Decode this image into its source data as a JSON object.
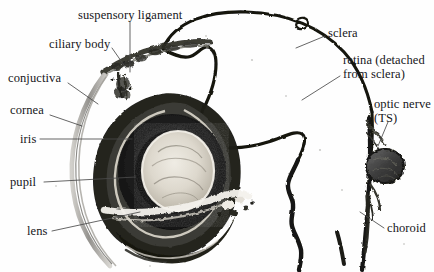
{
  "figure": {
    "background_color": "#fefefe",
    "ink_color": "#16161a",
    "leader_color": "#4a4a4a",
    "width": 434,
    "height": 272
  },
  "labels": [
    {
      "id": "suspensory-ligament",
      "text": "suspensory ligament",
      "x": 78,
      "y": 9,
      "align": "left"
    },
    {
      "id": "ciliary-body",
      "text": "ciliary body",
      "x": 49,
      "y": 38,
      "align": "left"
    },
    {
      "id": "conjuctiva",
      "text": "conjuctiva",
      "x": 8,
      "y": 72,
      "align": "left"
    },
    {
      "id": "cornea",
      "text": "cornea",
      "x": 10,
      "y": 104,
      "align": "left"
    },
    {
      "id": "iris",
      "text": "iris",
      "x": 20,
      "y": 133,
      "align": "left"
    },
    {
      "id": "pupil",
      "text": "pupil",
      "x": 10,
      "y": 176,
      "align": "left"
    },
    {
      "id": "lens",
      "text": "lens",
      "x": 27,
      "y": 225,
      "align": "left"
    },
    {
      "id": "sclera",
      "text": "sclera",
      "x": 328,
      "y": 27,
      "align": "left"
    },
    {
      "id": "retina-detached",
      "text": "retina (detached\nfrom sclera)",
      "x": 343,
      "y": 54,
      "align": "left"
    },
    {
      "id": "optic-nerve",
      "text": "optic nerve\n(TS)",
      "x": 374,
      "y": 98,
      "align": "left"
    },
    {
      "id": "choroid",
      "text": "choroid",
      "x": 387,
      "y": 222,
      "align": "left"
    }
  ],
  "structures": [
    {
      "id": "sclera-outline",
      "name": "sclera",
      "description": "large dark outline arc forming the posterior wall of the eyeball"
    },
    {
      "id": "retina-sheet",
      "name": "retina (detached)",
      "description": "thick dark sheet folded away from the sclera inside the globe"
    },
    {
      "id": "choroid-strip",
      "name": "choroid",
      "description": "narrow dark pigmented strip beside the optic nerve at lower right"
    },
    {
      "id": "optic-nerve-ts",
      "name": "optic nerve (TS)",
      "description": "rounded transverse-section bundle at right margin"
    },
    {
      "id": "cornea-arc",
      "name": "cornea",
      "description": "thin translucent grey arc at the anterior left"
    },
    {
      "id": "conjuctiva-arc",
      "name": "conjuctiva",
      "description": "outer thin membrane layer over the cornea"
    },
    {
      "id": "iris-ring",
      "name": "iris",
      "description": "broad black ring surrounding the pupil"
    },
    {
      "id": "pupil-aperture",
      "name": "pupil",
      "description": "central opening within the iris ring"
    },
    {
      "id": "lens-body",
      "name": "lens",
      "description": "pale rounded biconvex body at the centre"
    },
    {
      "id": "ciliary-body-band",
      "name": "ciliary body",
      "description": "granular dark band at the top where the lens is suspended"
    },
    {
      "id": "suspensory-ligament",
      "name": "suspensory ligament",
      "description": "fine fibres attaching the lens to the ciliary body"
    }
  ],
  "colors": {
    "ink": "#16161a",
    "leader": "#4a4a4a",
    "tissue_dark": "#1d1d1d",
    "tissue_mid": "#4e4e4e",
    "tissue_light": "#c9c6bf",
    "lens_pale": "#ded9cf",
    "background": "#fefefe"
  }
}
